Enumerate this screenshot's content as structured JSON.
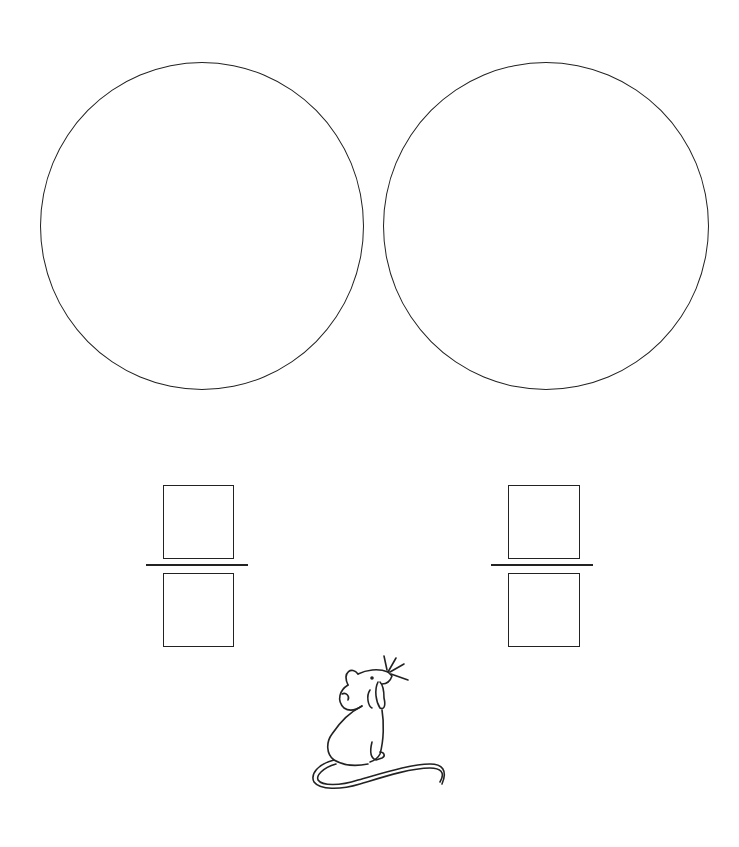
{
  "worksheet": {
    "type": "fraction-circles",
    "circles": [
      {
        "id": "circle-left",
        "x": 40,
        "y": 62,
        "w": 324,
        "h": 328
      },
      {
        "id": "circle-right",
        "x": 383,
        "y": 62,
        "w": 326,
        "h": 328
      }
    ],
    "fractions": [
      {
        "id": "fraction-left",
        "numerator": "",
        "denominator": ""
      },
      {
        "id": "fraction-right",
        "numerator": "",
        "denominator": ""
      }
    ],
    "illustration": "mouse",
    "line_color": "#222222"
  }
}
